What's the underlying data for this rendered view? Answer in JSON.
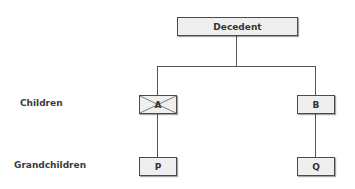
{
  "diagram": {
    "root": {
      "label": "Decedent"
    },
    "levels": [
      {
        "label": "Children"
      },
      {
        "label": "Grandchildren"
      }
    ],
    "children": [
      {
        "label": "A",
        "crossed_out": true
      },
      {
        "label": "B",
        "crossed_out": false
      }
    ],
    "grandchildren": [
      {
        "label": "P",
        "parent": "A"
      },
      {
        "label": "Q",
        "parent": "B"
      }
    ],
    "colors": {
      "box_fill": "#efefef",
      "box_border": "#4a4a4a",
      "line": "#555555",
      "text": "#333333"
    }
  }
}
